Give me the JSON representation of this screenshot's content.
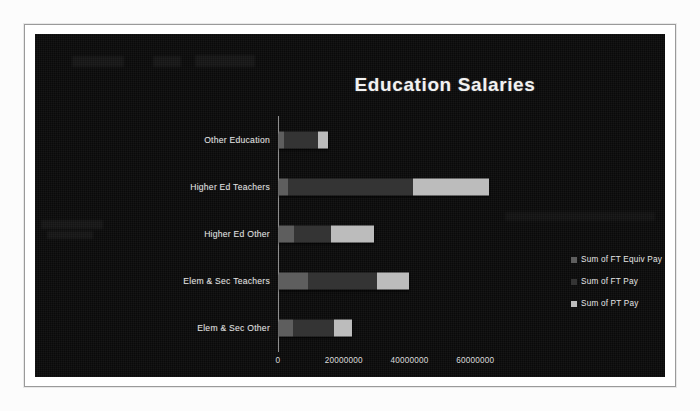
{
  "chart_data": {
    "type": "bar",
    "orientation": "horizontal",
    "stacked": true,
    "title": "Education Salaries",
    "xlabel": "",
    "ylabel": "",
    "grid": false,
    "legend_position": "right",
    "xlim": [
      0,
      70000000
    ],
    "x_ticks": [
      {
        "label": "0",
        "value": 0
      },
      {
        "label": "20000000",
        "value": 20000000
      },
      {
        "label": "40000000",
        "value": 40000000
      },
      {
        "label": "60000000",
        "value": 60000000
      }
    ],
    "categories": [
      "Other Education",
      "Higher Ed Teachers",
      "Higher Ed Other",
      "Elem & Sec Teachers",
      "Elem & Sec Other"
    ],
    "series": [
      {
        "name": "Sum of FT Equiv Pay",
        "color": "#5e5e5e",
        "values": [
          1400000,
          2800000,
          4700000,
          8900000,
          4200000
        ]
      },
      {
        "name": "Sum of FT Pay",
        "color": "#343434",
        "values": [
          10600000,
          38000000,
          11100000,
          21000000,
          12400000
        ]
      },
      {
        "name": "Sum of PT Pay",
        "color": "#bcbcbc",
        "values": [
          2900000,
          23200000,
          13200000,
          9800000,
          5600000
        ]
      }
    ],
    "totals": [
      14900000,
      64000000,
      29000000,
      39700000,
      22200000
    ]
  },
  "legend": {
    "items": [
      {
        "label": "Sum of FT Equiv Pay",
        "color": "#5e5e5e",
        "marker": "square-swatch"
      },
      {
        "label": "Sum of FT Pay",
        "color": "#343434",
        "marker": "square-swatch"
      },
      {
        "label": "Sum of PT Pay",
        "color": "#bcbcbc",
        "marker": "square-swatch"
      }
    ]
  },
  "colors": {
    "canvas_background": "#0a0a0a",
    "page_background": "#ffffff",
    "frame_border": "#9a9a9a",
    "axis_line": "#8e8e8e",
    "title_text": "#f2f2f2",
    "label_text": "#e2e2e2"
  }
}
